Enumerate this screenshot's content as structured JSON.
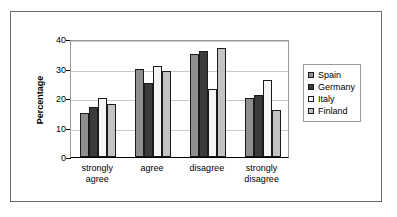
{
  "chart_data": {
    "type": "bar",
    "title": "",
    "subtitle": "",
    "xlabel": "",
    "ylabel": "Percentage",
    "ylim": [
      0,
      40
    ],
    "yticks": [
      0,
      10,
      20,
      30,
      40
    ],
    "grid": true,
    "legend_position": "right",
    "categories": [
      "strongly agree",
      "agree",
      "disagree",
      "strongly disagree"
    ],
    "category_lines": [
      [
        "strongly",
        "agree"
      ],
      [
        "agree",
        ""
      ],
      [
        "disagree",
        ""
      ],
      [
        "strongly",
        "disagree"
      ]
    ],
    "series": [
      {
        "name": "Spain",
        "color": "#8f8f8f",
        "values": [
          15,
          30,
          35,
          20
        ]
      },
      {
        "name": "Germany",
        "color": "#3b3b3b",
        "values": [
          17,
          25,
          36,
          21
        ]
      },
      {
        "name": "Italy",
        "color": "#f5f5f5",
        "values": [
          20,
          31,
          23,
          26
        ]
      },
      {
        "name": "Finland",
        "color": "#c3c3c3",
        "values": [
          18,
          29,
          37,
          16
        ]
      }
    ]
  },
  "axis": {
    "y_tick_labels": [
      "0",
      "10",
      "20",
      "30",
      "40"
    ],
    "y_title": "Percentage"
  },
  "legend": {
    "items": [
      {
        "label": "Spain"
      },
      {
        "label": "Germany"
      },
      {
        "label": "Italy"
      },
      {
        "label": "Finland"
      }
    ]
  }
}
